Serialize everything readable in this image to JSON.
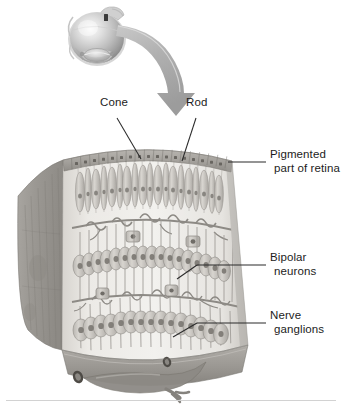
{
  "figure": {
    "type": "anatomical-illustration",
    "style": "grayscale-airbrush-rendering",
    "palette": {
      "background": "#ffffff",
      "text": "#1c1c1c",
      "leader_line": "#2b2b2b",
      "arrow_light": "#d9d9d9",
      "arrow_dark": "#9a9a9a",
      "eye_highlight": "#f2f2f2",
      "eye_midtone": "#b9b9b9",
      "eye_shadow": "#8a8a8a",
      "retina_light": "#e8e6e2",
      "retina_mid": "#b5b2ad",
      "retina_dark": "#8d8a86",
      "cut_face": "#9d9a95",
      "vessel": "#8f8c88",
      "baseline_rule": "#d2d2d2"
    },
    "labels": [
      {
        "id": "cone",
        "name": "Cone",
        "lines": [
          "Cone"
        ],
        "x": 100,
        "y": 103,
        "leader": {
          "from": [
            117,
            118
          ],
          "to": [
            140,
            158
          ]
        }
      },
      {
        "id": "rod",
        "name": "Rod",
        "lines": [
          "Rod"
        ],
        "x": 186,
        "y": 103,
        "leader": {
          "from": [
            196,
            118
          ],
          "to": [
            182,
            160
          ]
        }
      },
      {
        "id": "pigmented-part-of-retina",
        "name": "Pigmented part of retina",
        "lines": [
          "Pigmented",
          "part of retina"
        ],
        "x": 268,
        "y": 155,
        "leader": {
          "from": [
            266,
            162
          ],
          "to": [
            228,
            162
          ]
        }
      },
      {
        "id": "bipolar-neurons",
        "name": "Bipolar neurons",
        "lines": [
          "Bipolar",
          "neurons"
        ],
        "x": 268,
        "y": 258,
        "leader": {
          "from": [
            266,
            265
          ],
          "to": [
            196,
            265
          ]
        },
        "branch": {
          "from": [
            196,
            265
          ],
          "to": [
            176,
            280
          ]
        }
      },
      {
        "id": "nerve-ganglions",
        "name": "Nerve ganglions",
        "lines": [
          "Nerve",
          "ganglions"
        ],
        "x": 268,
        "y": 316,
        "leader": {
          "from": [
            266,
            323
          ],
          "to": [
            196,
            323
          ]
        },
        "branch": {
          "from": [
            196,
            323
          ],
          "to": [
            172,
            337
          ]
        }
      }
    ],
    "structures": [
      {
        "id": "eyeball",
        "name": "eyeball-overview",
        "description": "Shaded sphere of the eye with cornea and lens at lower left and optic nerve stub at upper right"
      },
      {
        "id": "zoom-arrow",
        "name": "magnification-arrow",
        "description": "Curved tapering arrow sweeping from eyeball down-right to the retina wedge"
      },
      {
        "id": "retina-wedge",
        "name": "retina-wedge",
        "description": "Curved block section of retina showing layered cells"
      },
      {
        "id": "pigment-epithelium",
        "name": "pigmented-epithelium-layer",
        "description": "Row of cuboidal pigment cells along the top arc"
      },
      {
        "id": "photoreceptors",
        "name": "photoreceptor-layer",
        "description": "Column of alternating rod and cone cells"
      },
      {
        "id": "horizontal-layer",
        "name": "horizontal-cell-layer",
        "description": "Interconnected synaptic band below photoreceptors"
      },
      {
        "id": "bipolar-layer",
        "name": "bipolar-neuron-layer",
        "description": "Spindle-shaped bipolar neuron cell bodies"
      },
      {
        "id": "amacrine-layer",
        "name": "amacrine-synaptic-layer",
        "description": "Second interconnected synaptic band"
      },
      {
        "id": "ganglion-layer",
        "name": "ganglion-cell-layer",
        "description": "Row of nerve ganglion cell bodies at the base"
      },
      {
        "id": "vessels",
        "name": "retinal-blood-vessels",
        "description": "Branching blood vessels on the inner retinal surface"
      },
      {
        "id": "cut-face",
        "name": "wedge-cut-face",
        "description": "Dark striated left cut surface of the wedge"
      }
    ]
  }
}
